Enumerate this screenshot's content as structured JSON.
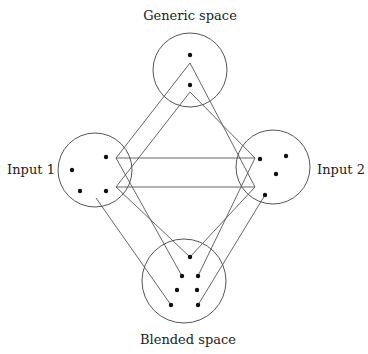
{
  "spaces": {
    "generic": {
      "label": "Generic space",
      "cx": 190,
      "cy": 70,
      "r": 37,
      "label_x": 190,
      "label_y": 20
    },
    "input1": {
      "label": "Input 1",
      "cx": 95,
      "cy": 170,
      "r": 37,
      "label_x": 31,
      "label_y": 174
    },
    "input2": {
      "label": "Input 2",
      "cx": 273,
      "cy": 167,
      "r": 37,
      "label_x": 341,
      "label_y": 174
    },
    "blended": {
      "label": "Blended space",
      "cx": 184,
      "cy": 281,
      "r": 42,
      "label_x": 188,
      "label_y": 344
    }
  },
  "dots": {
    "generic": [
      [
        190,
        55
      ],
      [
        190,
        85
      ]
    ],
    "input1": [
      [
        106,
        157
      ],
      [
        72,
        170
      ],
      [
        80,
        191
      ],
      [
        106,
        191
      ]
    ],
    "input2": [
      [
        260,
        159
      ],
      [
        286,
        156
      ],
      [
        276,
        174
      ],
      [
        265,
        195
      ]
    ],
    "blended": [
      [
        190,
        257
      ],
      [
        182,
        276
      ],
      [
        198,
        276
      ],
      [
        177,
        290
      ],
      [
        197,
        290
      ],
      [
        171,
        305
      ],
      [
        198,
        305
      ]
    ]
  },
  "links": [
    {
      "from": [
        190,
        63
      ],
      "to": [
        116,
        158
      ],
      "role": "generic-to-input1-outer"
    },
    {
      "from": [
        190,
        92
      ],
      "to": [
        116,
        187
      ],
      "role": "generic-to-input1-inner"
    },
    {
      "from": [
        190,
        63
      ],
      "to": [
        255,
        187
      ],
      "role": "generic-to-input2-outer"
    },
    {
      "from": [
        190,
        92
      ],
      "to": [
        255,
        158
      ],
      "role": "generic-to-input2-inner"
    },
    {
      "from": [
        116,
        158
      ],
      "to": [
        255,
        158
      ],
      "role": "cross-space-upper"
    },
    {
      "from": [
        116,
        187
      ],
      "to": [
        255,
        187
      ],
      "role": "cross-space-lower"
    },
    {
      "from": [
        116,
        158
      ],
      "to": [
        182,
        276
      ],
      "role": "input1-to-blend-a"
    },
    {
      "from": [
        116,
        187
      ],
      "to": [
        190,
        257
      ],
      "role": "input1-to-blend-b"
    },
    {
      "from": [
        96,
        198
      ],
      "to": [
        171,
        305
      ],
      "role": "input1-to-blend-c"
    },
    {
      "from": [
        255,
        187
      ],
      "to": [
        190,
        257
      ],
      "role": "input2-to-blend-a"
    },
    {
      "from": [
        255,
        158
      ],
      "to": [
        198,
        276
      ],
      "role": "input2-to-blend-b"
    },
    {
      "from": [
        265,
        195
      ],
      "to": [
        198,
        305
      ],
      "role": "input2-to-blend-c"
    }
  ]
}
